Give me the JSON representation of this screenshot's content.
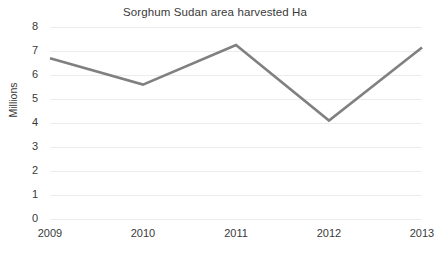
{
  "chart_data": {
    "type": "line",
    "title": "Sorghum Sudan area harvested Ha",
    "xlabel": "",
    "ylabel": "Millions",
    "categories": [
      "2009",
      "2010",
      "2011",
      "2012",
      "2013"
    ],
    "values": [
      6.7,
      5.6,
      7.25,
      4.1,
      7.15
    ],
    "series": [
      {
        "name": "Sorghum Sudan area harvested Ha",
        "values": [
          6.7,
          5.6,
          7.25,
          4.1,
          7.15
        ]
      }
    ],
    "ylim": [
      0,
      8
    ],
    "y_ticks": [
      0,
      1,
      2,
      3,
      4,
      5,
      6,
      7,
      8
    ],
    "y_tick_labels": [
      "0",
      "1",
      "2",
      "3",
      "4",
      "5",
      "6",
      "7",
      "8"
    ],
    "grid": true,
    "legend": false,
    "markers": false,
    "line_color": "#808080",
    "grid_color": "#ececed",
    "text_color": "#3a3a3a",
    "background": "#ffffff"
  }
}
